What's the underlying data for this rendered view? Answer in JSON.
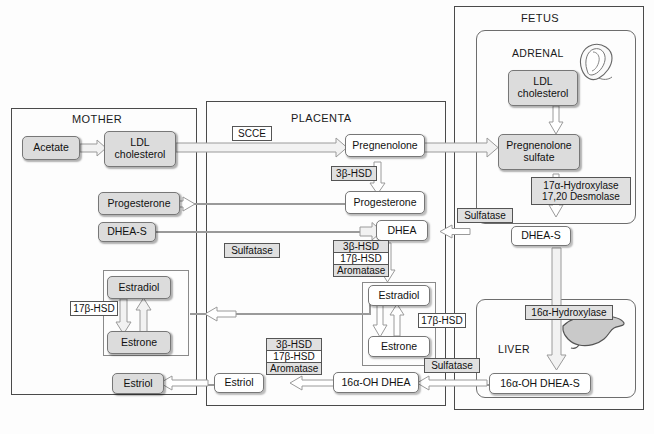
{
  "diagram": {
    "caption": "",
    "compartments": [
      {
        "name": "MOTHER"
      },
      {
        "name": "PLACENTA"
      },
      {
        "name": "FETUS"
      }
    ],
    "organs": [
      {
        "name": "ADRENAL"
      },
      {
        "name": "LIVER"
      }
    ]
  },
  "mother": {
    "title": "MOTHER",
    "nodes": {
      "acetate": "Acetate",
      "ldl_cholesterol": "LDL\ncholesterol",
      "ldl_line1": "LDL",
      "ldl_line2": "cholesterol",
      "progesterone": "Progesterone",
      "dhea_s": "DHEA-S",
      "estradiol": "Estradiol",
      "estrone": "Estrone",
      "estriol": "Estriol"
    },
    "enzymes": {
      "hsd17b": "17β-HSD"
    }
  },
  "placenta": {
    "title": "PLACENTA",
    "nodes": {
      "pregnenolone": "Pregnenolone",
      "progesterone": "Progesterone",
      "dhea": "DHEA",
      "estradiol": "Estradiol",
      "estrone": "Estrone",
      "estriol": "Estriol",
      "oh_dhea": "16α-OH DHEA"
    },
    "enzymes": {
      "scce": "SCCE",
      "hsd3b_top": "3β-HSD",
      "sulfatase_left": "Sulfatase",
      "stack_dhea": [
        "3β-HSD",
        "17β-HSD",
        "Aromatase"
      ],
      "hsd17b_mid": "17β-HSD",
      "stack_estriol": [
        "3β-HSD",
        "17β-HSD",
        "Aromatase"
      ]
    }
  },
  "fetus": {
    "title": "FETUS",
    "adrenal": {
      "title": "ADRENAL",
      "nodes": {
        "ldl_line1": "LDL",
        "ldl_line2": "cholesterol",
        "pregnenolone_sulfate_line1": "Pregnenolone",
        "pregnenolone_sulfate_line2": "sulfate"
      },
      "enzymes": {
        "hydroxylase_line1": "17α-Hydroxylase",
        "hydroxylase_line2": "17,20 Desmolase"
      },
      "icon": "adrenal-gland-icon"
    },
    "liver": {
      "title": "LIVER",
      "nodes": {
        "oh_dhea_s": "16α-OH DHEA-S"
      },
      "enzymes": {
        "hydroxylase16a": "16α-Hydroxylase"
      },
      "icon": "liver-icon"
    },
    "nodes": {
      "dhea_s": "DHEA-S"
    },
    "enzymes": {
      "sulfatase_dhea": "Sulfatase",
      "sulfatase_ohdhea": "Sulfatase"
    }
  },
  "colors": {
    "node_fill_maternal": "#dcdcdc",
    "node_fill_placental": "#ffffff",
    "border": "#777777",
    "arrow_stroke": "#9a9a9a",
    "frame": "#4a4a4a",
    "organ_icon_fill": "#cccccc"
  }
}
